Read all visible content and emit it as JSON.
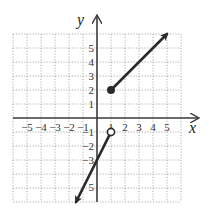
{
  "chart_data": {
    "type": "line",
    "title": "",
    "xlabel": "x",
    "ylabel": "y",
    "xlim": [
      -6,
      6
    ],
    "ylim": [
      -6,
      6
    ],
    "grid": true,
    "grid_style": "dotted",
    "x_ticks": [
      -5,
      -4,
      -3,
      -2,
      -1,
      1,
      2,
      3,
      4,
      5
    ],
    "x_tick_labels": [
      "−5",
      "−4",
      "−3",
      "−2",
      "−1",
      "1",
      "2",
      "3",
      "4",
      "5"
    ],
    "y_ticks": [
      5,
      4,
      3,
      2,
      1,
      -1,
      -2,
      -3,
      -5
    ],
    "y_tick_labels": [
      "5",
      "4",
      "3",
      "2",
      "1",
      "−1",
      "−2",
      "−3",
      "5"
    ],
    "series": [
      {
        "name": "upper-piece",
        "equation": "y = x + 1, x >= 1",
        "start": {
          "x": 1,
          "y": 2,
          "endpoint": "closed"
        },
        "end": {
          "x": 5,
          "y": 6,
          "endpoint": "arrow"
        },
        "points": [
          [
            1,
            2
          ],
          [
            5,
            6
          ]
        ]
      },
      {
        "name": "lower-piece",
        "equation": "y = 2x - 3, x < 1",
        "start": {
          "x": 1,
          "y": -1,
          "endpoint": "open"
        },
        "end": {
          "x": -1.5,
          "y": -6,
          "endpoint": "arrow"
        },
        "points": [
          [
            1,
            -1
          ],
          [
            -1.5,
            -6
          ]
        ]
      }
    ],
    "colors": {
      "line": "#2a2a2a",
      "axis": "#3a3a3a",
      "grid": "#9a9a9a"
    }
  },
  "labels": {
    "x_axis": "x",
    "y_axis": "y"
  }
}
